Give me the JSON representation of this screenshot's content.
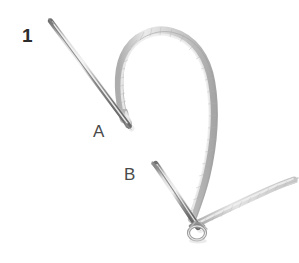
{
  "figure": {
    "type": "instructional-illustration",
    "background_color": "#ffffff",
    "step_number": "1",
    "labels": {
      "step": "1",
      "point_a": "A",
      "point_b": "B"
    },
    "label_color": "#3b3b3b",
    "step_label_color": "#2c2c2c"
  },
  "elements": {
    "thread": {
      "name": "suture-thread-loop",
      "color_light": "#e6e6e6",
      "color_mid": "#c9c9c9",
      "color_dark": "#a8a8a8",
      "description": "pale gray braided cord forming a tall inverted-U loop, ends converging at lower knot"
    },
    "needle_a": {
      "name": "needle-a",
      "color_light": "#e0e0e0",
      "color_mid": "#9a9a9a",
      "color_dark": "#6e6e6e",
      "description": "straight tapered metallic needle running from upper-left down to point A"
    },
    "needle_b": {
      "name": "needle-b",
      "color_light": "#e0e0e0",
      "color_mid": "#9a9a9a",
      "color_dark": "#6e6e6e",
      "description": "straight tapered metallic needle running from point B down-right to the knot"
    },
    "thread_tail": {
      "name": "thread-tail",
      "color_light": "#dcdcdc",
      "color_mid": "#b4b4b4",
      "description": "short free end of cord extending to the upper right from the knot"
    },
    "knot": {
      "name": "thread-knot",
      "color": "#8e8e8e",
      "description": "small tight loop where both thread ends and needle B meet"
    }
  }
}
